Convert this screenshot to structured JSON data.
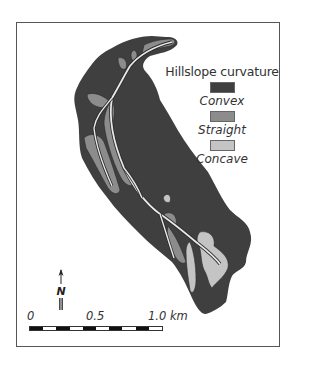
{
  "map": {
    "legend": {
      "title": "Hillslope curvature",
      "items": [
        {
          "label": "Convex",
          "color": "#3f3f3f"
        },
        {
          "label": "Straight",
          "color": "#8c8c8c"
        },
        {
          "label": "Concave",
          "color": "#c4c4c4"
        }
      ]
    },
    "scale_bar": {
      "labels": [
        "0",
        "0.5",
        "1.0 km"
      ],
      "segments": 10
    },
    "north_arrow": {
      "label": "N"
    },
    "colors": {
      "convex": "#3f3f3f",
      "straight": "#8c8c8c",
      "concave": "#c4c4c4",
      "channel": "#e8e8e8",
      "border": "#555555"
    }
  }
}
